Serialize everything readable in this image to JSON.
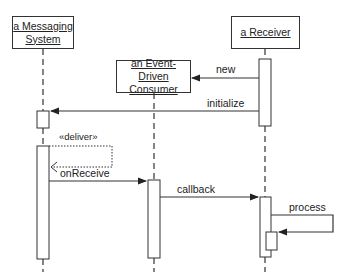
{
  "participants": [
    {
      "id": "messaging",
      "label_line1": "a Messaging",
      "label_line2": "System"
    },
    {
      "id": "consumer",
      "label_line1": "an Event-Driven",
      "label_line2": "Consumer"
    },
    {
      "id": "receiver",
      "label_line1": "a Receiver",
      "label_line2": ""
    }
  ],
  "messages": [
    {
      "label": "new",
      "from": "receiver",
      "to": "consumer"
    },
    {
      "label": "initialize",
      "from": "receiver",
      "to": "messaging"
    },
    {
      "label": "«deliver»",
      "from": "messaging",
      "to": "messaging",
      "style": "dotted"
    },
    {
      "label": "onReceive",
      "from": "messaging",
      "to": "consumer"
    },
    {
      "label": "callback",
      "from": "consumer",
      "to": "receiver"
    },
    {
      "label": "process",
      "from": "receiver",
      "to": "receiver"
    }
  ],
  "colors": {
    "line": "#333333",
    "background": "#ffffff"
  }
}
